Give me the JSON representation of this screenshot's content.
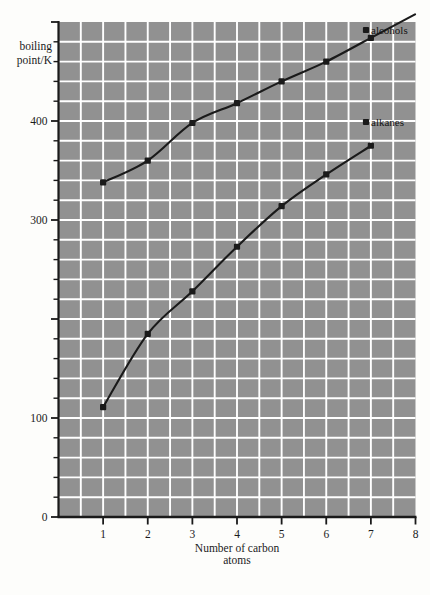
{
  "chart_data": {
    "type": "line",
    "title": "",
    "xlabel": "Number of carbon atoms",
    "ylabel": "boiling point/K",
    "ylabel_line1": "boiling",
    "ylabel_line2": "point/K",
    "xlabel_line1": "Number of carbon",
    "xlabel_line2": "atoms",
    "xlim": [
      0,
      8
    ],
    "ylim": [
      0,
      500
    ],
    "x_ticks": [
      1,
      2,
      3,
      4,
      5,
      6,
      7,
      8
    ],
    "x_tick_labels": [
      "1",
      "2",
      "3",
      "4",
      "5",
      "6",
      "7",
      "8"
    ],
    "y_ticks": [
      0,
      100,
      200,
      300,
      400
    ],
    "y_tick_labels_shown": [
      "0",
      "100",
      "300",
      "400"
    ],
    "y_minor_step": 20,
    "x_minor_step": 0.5,
    "grid": true,
    "grid_color": "#ffffff",
    "plot_background": "#919191",
    "legend_position": "inline-right",
    "series": [
      {
        "name": "alcohols",
        "label": "alcohols",
        "x": [
          1,
          2,
          3,
          4,
          5,
          6,
          7
        ],
        "values": [
          338,
          360,
          398,
          418,
          440,
          460,
          484
        ],
        "marker": "square",
        "color": "#1a1a1a"
      },
      {
        "name": "alkanes",
        "label": "alkanes",
        "x": [
          1,
          2,
          3,
          4,
          5,
          6,
          7
        ],
        "values": [
          111,
          185,
          228,
          273,
          314,
          346,
          375
        ],
        "marker": "square",
        "color": "#1a1a1a"
      }
    ]
  },
  "figure": {
    "axis_color": "#1a1a1a",
    "paper_color": "#fdfdfb"
  }
}
